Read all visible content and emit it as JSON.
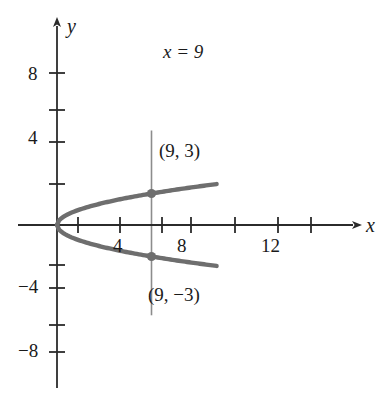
{
  "figure": {
    "background_color": "#ffffff",
    "curve_color": "#6e6e6e",
    "axis_color": "#2b2b2b",
    "vline_color": "#8c8c8c",
    "point_color": "#6e6e6e"
  },
  "axes": {
    "x_name": "x",
    "y_name": "y",
    "x_ticks_labeled": [
      {
        "value": 4,
        "label": "4"
      },
      {
        "value": 8,
        "label": "8"
      },
      {
        "value": 12,
        "label": "12"
      }
    ],
    "y_ticks_labeled": [
      {
        "value": 8,
        "label": "8"
      },
      {
        "value": 4,
        "label": "4"
      },
      {
        "value": -4,
        "label": "−4"
      },
      {
        "value": -8,
        "label": "−8"
      }
    ]
  },
  "annotations": {
    "vertical_line_label": "x = 9",
    "point_top_label": "(9, 3)",
    "point_bottom_label": "(9, −3)"
  },
  "chart_data": {
    "type": "line",
    "title": "",
    "xlabel": "x",
    "ylabel": "y",
    "xlim": [
      -1.5,
      15.5
    ],
    "ylim": [
      -9.5,
      9.5
    ],
    "grid": false,
    "legend": null,
    "series": [
      {
        "name": "y = sqrt(x)  (upper branch of x = y²)",
        "x": [
          0,
          0.25,
          1,
          2.25,
          4,
          6.25,
          9,
          12.25,
          14,
          15
        ],
        "values": [
          0,
          0.5,
          1,
          1.5,
          2,
          2.5,
          3,
          3.5,
          3.742,
          3.873
        ]
      },
      {
        "name": "y = -sqrt(x)  (lower branch of x = y²)",
        "x": [
          0,
          0.25,
          1,
          2.25,
          4,
          6.25,
          9,
          12.25,
          14,
          15
        ],
        "values": [
          0,
          -0.5,
          -1,
          -1.5,
          -2,
          -2.5,
          -3,
          -3.5,
          -3.742,
          -3.873
        ]
      },
      {
        "name": "x = 9 (vertical line)",
        "x": [
          9,
          9
        ],
        "values": [
          -8.6,
          9.0
        ]
      }
    ],
    "points": [
      {
        "label": "(9, 3)",
        "x": 9,
        "y": 3
      },
      {
        "label": "(9, −3)",
        "x": 9,
        "y": -3
      }
    ],
    "x_ticks": [
      2,
      4,
      6,
      8,
      10,
      12,
      14
    ],
    "y_ticks": [
      -8,
      -6,
      -4,
      -2,
      2,
      4,
      6,
      8
    ],
    "x_tick_labels": [
      "",
      "4",
      "",
      "8",
      "",
      "12",
      ""
    ],
    "y_tick_labels": [
      "−8",
      "",
      "−4",
      "",
      "",
      "4",
      "",
      "8"
    ]
  }
}
